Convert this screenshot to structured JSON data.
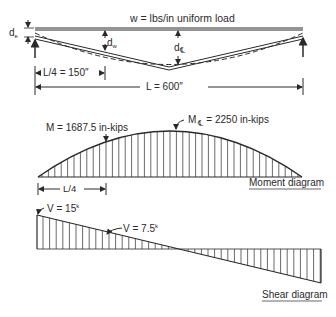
{
  "beam": {
    "load_label": "w = lbs/in uniform load",
    "end_deflection_label": "d",
    "end_deflection_sub": "e",
    "quarter_deflection_label": "d",
    "quarter_deflection_sub": "w",
    "center_deflection_label": "d",
    "center_deflection_sub": "℄",
    "quarter_span_label": "L/4 = 150″",
    "span_label": "L = 600″"
  },
  "moment": {
    "quarter_label": "M = 1687.5 in-kips",
    "center_label_m": "M",
    "center_label_sub": "℄",
    "center_label_rest": "= 2250 in-kips",
    "quarter_dim_label": "L/4",
    "title": "Moment diagram"
  },
  "shear": {
    "end_label": "V = 15",
    "end_label_sup": "k",
    "quarter_label": "V = 7.5",
    "quarter_label_sup": "k",
    "title": "Shear diagram"
  },
  "colors": {
    "ink": "#2a2a2a",
    "background": "#ffffff"
  }
}
